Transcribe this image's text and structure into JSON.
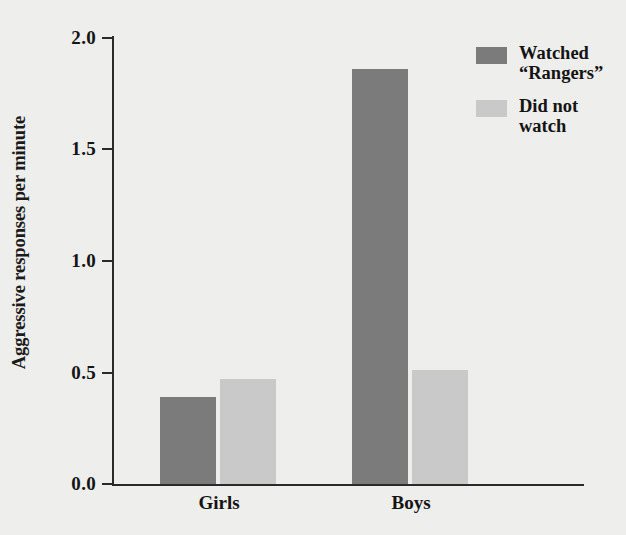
{
  "chart_data": {
    "type": "bar",
    "title": "",
    "subtitle": "",
    "xlabel": "",
    "ylabel": "Aggressive responses per minute",
    "categories": [
      "Girls",
      "Boys"
    ],
    "series": [
      {
        "name": "Watched \"Rangers\"",
        "values": [
          0.39,
          1.86
        ],
        "color": "#7b7b7b"
      },
      {
        "name": "Did not watch",
        "values": [
          0.47,
          0.51
        ],
        "color": "#c9c9c9"
      }
    ],
    "ylim": [
      0.0,
      2.0
    ],
    "yticks": [
      0.0,
      0.5,
      1.0,
      1.5,
      2.0
    ],
    "ytick_labels": [
      "0.0",
      "0.5",
      "1.0",
      "1.5",
      "2.0"
    ],
    "grid": false,
    "legend_position": "top-right"
  },
  "axis": {
    "y_title": "Aggressive responses per minute",
    "tick_0": "0.0",
    "tick_1": "0.5",
    "tick_2": "1.0",
    "tick_3": "1.5",
    "tick_4": "2.0"
  },
  "categories": {
    "girls": "Girls",
    "boys": "Boys"
  },
  "legend": {
    "item_watched": "Watched\n“Rangers”",
    "item_not_watched": "Did not\nwatch"
  },
  "colors": {
    "bar_dark": "#7b7b7b",
    "bar_light": "#c9c9c9",
    "axis": "#2a2a2a",
    "background": "#eeeeec",
    "text": "#141414"
  }
}
